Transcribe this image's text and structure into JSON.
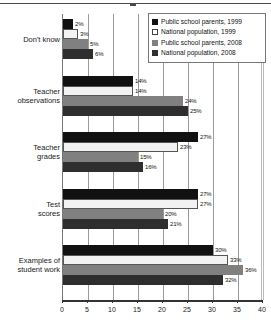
{
  "chart_data": {
    "type": "bar",
    "orientation": "horizontal",
    "title": "",
    "xlabel": "",
    "ylabel": "",
    "xlim": [
      0,
      40
    ],
    "xticks": [
      0,
      5,
      10,
      15,
      20,
      25,
      30,
      35,
      40
    ],
    "xtick_labels": [
      "0",
      "5",
      "10",
      "15",
      "20",
      "25",
      "30",
      "35",
      "40"
    ],
    "grid": "vertical",
    "legend_position": "top-right",
    "value_suffix": "%",
    "categories": [
      "Don't know",
      "Teacher observations",
      "Teacher grades",
      "Test scores",
      "Examples of student work"
    ],
    "category_lines": [
      [
        "Don't know"
      ],
      [
        "Teacher",
        "observations"
      ],
      [
        "Teacher",
        "grades"
      ],
      [
        "Test",
        "scores"
      ],
      [
        "Examples of",
        "student work"
      ]
    ],
    "series": [
      {
        "name": "Public school parents, 1999",
        "color": "#111111",
        "values": [
          2,
          14,
          27,
          27,
          30
        ],
        "labels": [
          "2%",
          "14%",
          "27%",
          "27%",
          "30%"
        ]
      },
      {
        "name": "National population, 1999",
        "color": "#f2f2f2",
        "values": [
          3,
          14,
          23,
          27,
          33
        ],
        "labels": [
          "3%",
          "14%",
          "23%",
          "27%",
          "33%"
        ]
      },
      {
        "name": "Public school parents, 2008",
        "color": "#808080",
        "values": [
          5,
          24,
          15,
          20,
          36
        ],
        "labels": [
          "5%",
          "24%",
          "15%",
          "20%",
          "36%"
        ]
      },
      {
        "name": "National population, 2008",
        "color": "#2e2e2e",
        "values": [
          6,
          25,
          16,
          21,
          32
        ],
        "labels": [
          "6%",
          "25%",
          "16%",
          "21%",
          "32%"
        ]
      }
    ]
  },
  "legend": {
    "items": [
      {
        "label": "Public school parents, 1999",
        "swatch": "black-square-icon"
      },
      {
        "label": "National population, 1999",
        "swatch": "white-square-icon"
      },
      {
        "label": "Public school parents, 2008",
        "swatch": "gray-square-icon"
      },
      {
        "label": "National population, 2008",
        "swatch": "dark-gray-square-icon"
      }
    ]
  }
}
